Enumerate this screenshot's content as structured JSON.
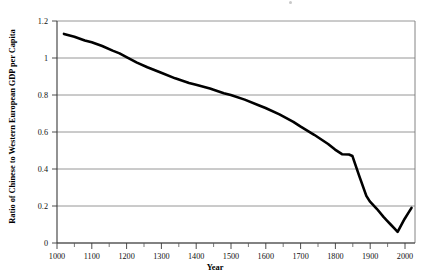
{
  "chart_data": {
    "type": "line",
    "title": "",
    "xlabel": "Year",
    "ylabel": "Ratio of Chinese to Western European GDP per Capita",
    "xlim": [
      1000,
      2030
    ],
    "ylim": [
      0,
      1.2
    ],
    "grid": true,
    "legend": null,
    "xticks": [
      1000,
      1100,
      1200,
      1300,
      1400,
      1500,
      1600,
      1700,
      1800,
      1900,
      2000
    ],
    "xtick_labels": [
      "1000",
      "1100",
      "1200",
      "1300",
      "1400",
      "1500",
      "1600",
      "1700",
      "1800",
      "1900",
      "2000"
    ],
    "xminor_ticks": [
      1050,
      1150,
      1250,
      1350,
      1450,
      1550,
      1650,
      1750,
      1850,
      1950
    ],
    "yticks": [
      0,
      0.2,
      0.4,
      0.6,
      0.8,
      1,
      1.2
    ],
    "ytick_labels": [
      "0",
      "0.2",
      "0.4",
      "0.6",
      "0.8",
      "1",
      "1.2"
    ],
    "line_color": "#000000",
    "grid_color": "#8a8a8a",
    "series": [
      {
        "name": "Ratio of Chinese to Western European GDP per Capita",
        "x": [
          1020,
          1050,
          1080,
          1100,
          1130,
          1160,
          1180,
          1200,
          1230,
          1260,
          1300,
          1340,
          1380,
          1400,
          1440,
          1480,
          1500,
          1540,
          1580,
          1600,
          1640,
          1680,
          1700,
          1740,
          1780,
          1800,
          1820,
          1840,
          1850,
          1870,
          1890,
          1900,
          1920,
          1940,
          1950,
          1960,
          1970,
          1980,
          1990,
          2000,
          2010,
          2020
        ],
        "y": [
          1.13,
          1.115,
          1.095,
          1.085,
          1.065,
          1.04,
          1.025,
          1.005,
          0.975,
          0.95,
          0.92,
          0.89,
          0.865,
          0.855,
          0.835,
          0.81,
          0.8,
          0.775,
          0.745,
          0.73,
          0.695,
          0.655,
          0.63,
          0.585,
          0.535,
          0.505,
          0.48,
          0.478,
          0.47,
          0.36,
          0.255,
          0.225,
          0.185,
          0.14,
          0.12,
          0.1,
          0.08,
          0.06,
          0.095,
          0.13,
          0.16,
          0.19
        ]
      }
    ],
    "annotations": [
      {
        "text": "plateau near 0.48 between 1820 and 1850"
      },
      {
        "text": "trough at 0.06 near 1980"
      },
      {
        "text": "recovery to 0.19 by 2020"
      }
    ]
  }
}
